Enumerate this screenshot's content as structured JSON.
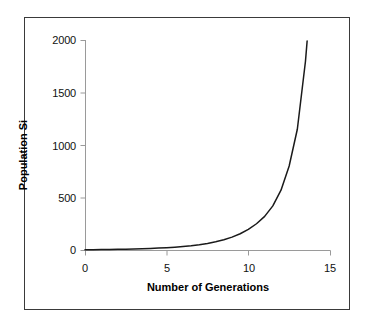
{
  "chart_data": {
    "type": "line",
    "title": "",
    "xlabel": "Number of Generations",
    "ylabel": "Population Si",
    "xlim": [
      0,
      15
    ],
    "ylim": [
      0,
      2000
    ],
    "xticks": [
      "0",
      "5",
      "10",
      "15"
    ],
    "yticks": [
      "0",
      "500",
      "1000",
      "1500",
      "2000"
    ],
    "xtick_values": [
      0,
      5,
      10,
      15
    ],
    "ytick_values": [
      0,
      500,
      1000,
      1500,
      2000
    ],
    "grid": false,
    "legend": false,
    "legend_position": "none",
    "series": [
      {
        "name": "Population Size",
        "color": "#1a1a1a",
        "x": [
          0,
          0.5,
          1,
          1.5,
          2,
          2.5,
          3,
          3.5,
          4,
          4.5,
          5,
          5.5,
          6,
          6.5,
          7,
          7.5,
          8,
          8.5,
          9,
          9.5,
          10,
          10.5,
          11,
          11.5,
          12,
          12.5,
          13,
          13.5,
          13.6
        ],
        "y": [
          2,
          3,
          4,
          5,
          6,
          8,
          10,
          12,
          15,
          18,
          22,
          27,
          33,
          40,
          50,
          62,
          78,
          98,
          123,
          155,
          196,
          250,
          320,
          420,
          570,
          800,
          1150,
          1800,
          1990
        ]
      }
    ],
    "axis_color": "#9a9a9a",
    "frame_color": "#3a3a3a",
    "background": "#ffffff",
    "pixel_geometry": {
      "x_origin_px": 85,
      "x_end_px": 330,
      "y_origin_px": 250,
      "y_top_px": 40
    }
  },
  "frame": {
    "label": "chart-frame"
  },
  "axes": {
    "y_title": "Population Si",
    "x_title": "Number of Generations",
    "y_tick_0": "0",
    "y_tick_500": "500",
    "y_tick_1000": "1000",
    "y_tick_1500": "1500",
    "y_tick_2000": "2000",
    "x_tick_0": "0",
    "x_tick_5": "5",
    "x_tick_10": "10",
    "x_tick_15": "15"
  }
}
